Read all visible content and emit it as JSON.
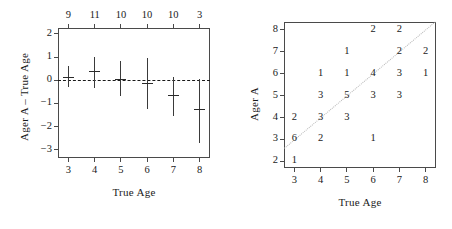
{
  "figure": {
    "panels": [
      "left",
      "right"
    ]
  },
  "left_panel": {
    "xlabel": "True Age",
    "ylabel": "Ager A – True Age",
    "x_ticks": [
      "3",
      "4",
      "5",
      "6",
      "7",
      "8"
    ],
    "y_ticks": [
      "2",
      "1",
      "0",
      "−1",
      "−2",
      "−3"
    ],
    "top_counts": [
      "9",
      "11",
      "10",
      "10",
      "10",
      "3"
    ],
    "reference_line": "0"
  },
  "right_panel": {
    "xlabel": "True Age",
    "ylabel": "Ager A",
    "x_ticks": [
      "3",
      "4",
      "5",
      "6",
      "7",
      "8"
    ],
    "y_ticks": [
      "8",
      "7",
      "6",
      "5",
      "4",
      "3",
      "2"
    ]
  },
  "chart_data": [
    {
      "type": "scatter",
      "panel": "left",
      "title": "",
      "xlabel": "True Age",
      "ylabel": "Ager A – True Age",
      "xlim": [
        2.6,
        8.4
      ],
      "ylim": [
        -3.35,
        2.25
      ],
      "grid": false,
      "legend": "none",
      "reference_line_y": 0,
      "reference_line_style": "dashed",
      "top_axis_label": "sample size",
      "x": [
        3,
        4,
        5,
        6,
        7,
        8
      ],
      "n": [
        9,
        11,
        10,
        10,
        10,
        3
      ],
      "mean": [
        0.15,
        0.4,
        0.05,
        -0.1,
        -0.63,
        -1.25
      ],
      "lower": [
        -0.3,
        -0.35,
        -0.68,
        -1.25,
        -1.55,
        -2.7
      ],
      "upper": [
        0.6,
        1.0,
        0.82,
        0.95,
        0.12,
        0.05
      ]
    },
    {
      "type": "heatmap",
      "panel": "right",
      "title": "",
      "xlabel": "True Age",
      "ylabel": "Ager A",
      "xlim": [
        2.6,
        8.4
      ],
      "ylim": [
        1.7,
        8.35
      ],
      "grid": false,
      "legend": "none",
      "reference_line": "1:1 diagonal, dotted",
      "x_categories": [
        3,
        4,
        5,
        6,
        7,
        8
      ],
      "y_categories": [
        8,
        7,
        6,
        5,
        4,
        3,
        2
      ],
      "cells": [
        {
          "x": 6,
          "y": 8,
          "count": "2"
        },
        {
          "x": 7,
          "y": 8,
          "count": "2"
        },
        {
          "x": 5,
          "y": 7,
          "count": "1"
        },
        {
          "x": 7,
          "y": 7,
          "count": "2"
        },
        {
          "x": 8,
          "y": 7,
          "count": "2"
        },
        {
          "x": 4,
          "y": 6,
          "count": "1"
        },
        {
          "x": 5,
          "y": 6,
          "count": "1"
        },
        {
          "x": 6,
          "y": 6,
          "count": "4"
        },
        {
          "x": 7,
          "y": 6,
          "count": "3"
        },
        {
          "x": 8,
          "y": 6,
          "count": "1"
        },
        {
          "x": 4,
          "y": 5,
          "count": "3"
        },
        {
          "x": 5,
          "y": 5,
          "count": "5"
        },
        {
          "x": 6,
          "y": 5,
          "count": "3"
        },
        {
          "x": 7,
          "y": 5,
          "count": "3"
        },
        {
          "x": 3,
          "y": 4,
          "count": "2"
        },
        {
          "x": 4,
          "y": 4,
          "count": "3"
        },
        {
          "x": 5,
          "y": 4,
          "count": "3"
        },
        {
          "x": 3,
          "y": 3,
          "count": "6"
        },
        {
          "x": 4,
          "y": 3,
          "count": "2"
        },
        {
          "x": 6,
          "y": 3,
          "count": "1"
        },
        {
          "x": 3,
          "y": 2,
          "count": "1"
        }
      ]
    }
  ]
}
